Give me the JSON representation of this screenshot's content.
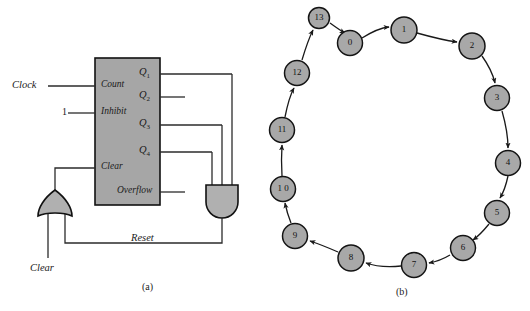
{
  "figure": {
    "caption_a": "(a)",
    "caption_b": "(b)"
  },
  "circuit": {
    "external_inputs": [
      {
        "name": "clock",
        "label": "Clock"
      },
      {
        "name": "inhibit-constant",
        "label": "1"
      },
      {
        "name": "clear",
        "label": "Clear"
      }
    ],
    "chip_input_pins": [
      {
        "name": "count",
        "label": "Count"
      },
      {
        "name": "inhibit",
        "label": "Inhibit"
      },
      {
        "name": "clear",
        "label": "Clear"
      }
    ],
    "chip_output_pins": [
      {
        "name": "q1",
        "label": "Q",
        "sub": "1"
      },
      {
        "name": "q2",
        "label": "Q",
        "sub": "2"
      },
      {
        "name": "q3",
        "label": "Q",
        "sub": "3"
      },
      {
        "name": "q4",
        "label": "Q",
        "sub": "4"
      },
      {
        "name": "overflow",
        "label": "Overflow",
        "sub": ""
      }
    ],
    "feedback_label": "Reset",
    "gates": [
      {
        "name": "and-gate",
        "type": "AND",
        "inputs": 3
      },
      {
        "name": "or-gate",
        "type": "OR",
        "inputs": 2
      }
    ],
    "colors": {
      "chip_fill": "#a6a6a6",
      "gate_fill": "#b0b0b0",
      "wire": "#2b2b2b",
      "outline": "#111111"
    }
  },
  "state_diagram": {
    "title": "",
    "direction": "clockwise",
    "node_fill": "#a8a8a8",
    "node_outline": "#141414",
    "states": [
      {
        "label": "13",
        "cx": 319,
        "cy": 18,
        "r": 10.5
      },
      {
        "label": "0",
        "cx": 350,
        "cy": 43,
        "r": 12.5
      },
      {
        "label": "1",
        "cx": 404,
        "cy": 30,
        "r": 13
      },
      {
        "label": "2",
        "cx": 472,
        "cy": 46,
        "r": 13
      },
      {
        "label": "3",
        "cx": 497,
        "cy": 98,
        "r": 12.5
      },
      {
        "label": "4",
        "cx": 508,
        "cy": 163,
        "r": 12.5
      },
      {
        "label": "5",
        "cx": 497,
        "cy": 213,
        "r": 12.5
      },
      {
        "label": "6",
        "cx": 463,
        "cy": 248,
        "r": 12.5
      },
      {
        "label": "7",
        "cx": 414,
        "cy": 265,
        "r": 12.5
      },
      {
        "label": "8",
        "cx": 351,
        "cy": 258,
        "r": 13
      },
      {
        "label": "9",
        "cx": 295,
        "cy": 236,
        "r": 12.5
      },
      {
        "label": "1 0",
        "cx": 283,
        "cy": 189,
        "r": 12.5
      },
      {
        "label": "11",
        "cx": 282,
        "cy": 130,
        "r": 12.5
      },
      {
        "label": "12",
        "cx": 297,
        "cy": 73,
        "r": 12.5
      }
    ],
    "transitions": [
      "13->0",
      "0->1",
      "1->2",
      "2->3",
      "3->4",
      "4->5",
      "5->6",
      "6->7",
      "7->8",
      "8->9",
      "9->10",
      "10->11",
      "11->12",
      "12->13"
    ]
  }
}
